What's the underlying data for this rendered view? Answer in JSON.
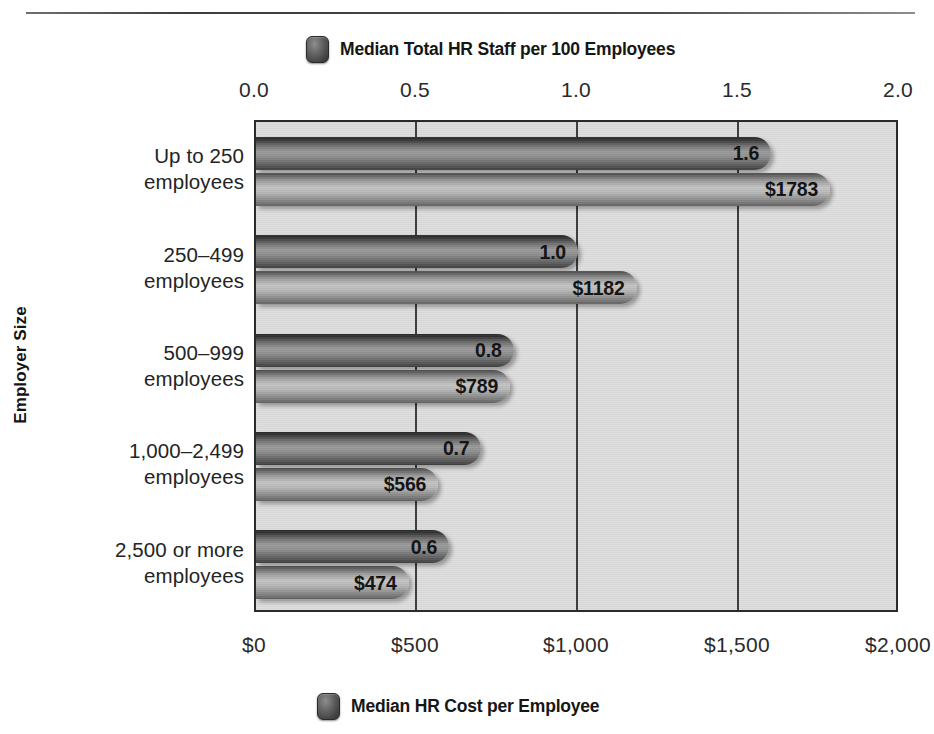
{
  "chart_data": {
    "type": "bar",
    "title": "",
    "orientation": "horizontal",
    "ylabel": "Employer Size",
    "xlabel": "",
    "grid": true,
    "categories": [
      "Up to 250 employees",
      "250–499 employees",
      "500–999 employees",
      "1,000–2,499 employees",
      "2,500 or more employees"
    ],
    "series": [
      {
        "name": "Median Total HR Staff per 100 Employees",
        "axis": "top",
        "values": [
          1.6,
          1.0,
          0.8,
          0.7,
          0.6
        ],
        "labels": [
          "1.6",
          "1.0",
          "0.8",
          "0.7",
          "0.6"
        ],
        "axis_range": [
          0.0,
          2.0
        ],
        "tick_values": [
          0.0,
          0.5,
          1.0,
          1.5,
          2.0
        ],
        "tick_labels": [
          "0.0",
          "0.5",
          "1.0",
          "1.5",
          "2.0"
        ],
        "color": "#555555"
      },
      {
        "name": "Median HR Cost per Employee",
        "axis": "bottom",
        "values": [
          1783,
          1182,
          789,
          566,
          474
        ],
        "labels": [
          "$1783",
          "$1182",
          "$789",
          "$566",
          "$474"
        ],
        "axis_range": [
          0,
          2000
        ],
        "tick_values": [
          0,
          500,
          1000,
          1500,
          2000
        ],
        "tick_labels": [
          "$0",
          "$500",
          "$1,000",
          "$1,500",
          "$2,000"
        ],
        "color": "#a0a0a0"
      }
    ],
    "legend_position": "top and bottom, centered"
  },
  "axes": {
    "y_title": "Employer Size",
    "category_lines": [
      [
        "Up to 250",
        "employees"
      ],
      [
        "250–499",
        "employees"
      ],
      [
        "500–999",
        "employees"
      ],
      [
        "1,000–2,499",
        "employees"
      ],
      [
        "2,500 or more",
        "employees"
      ]
    ],
    "top_ticks": [
      "0.0",
      "0.5",
      "1.0",
      "1.5",
      "2.0"
    ],
    "bottom_ticks": [
      "$0",
      "$500",
      "$1,000",
      "$1,500",
      "$2,000"
    ]
  },
  "legends": {
    "top": "Median Total HR Staff per 100 Employees",
    "bottom": "Median HR Cost per Employee",
    "swatch_icon": "rounded-square-swatch-icon"
  },
  "colors": {
    "plot_background": "#dcdcdc",
    "plot_border": "#2b2b2b",
    "gridline": "#3a3a3a",
    "bar_staff": "#555555",
    "bar_cost": "#a0a0a0",
    "text": "#1a1a1a",
    "page_background": "#ffffff"
  }
}
